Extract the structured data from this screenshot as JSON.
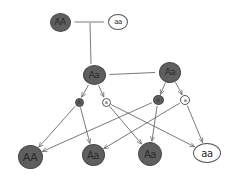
{
  "title": "",
  "colors": {
    "dominant_fill": "#5f5f5f",
    "recessive_fill": "#ffffff",
    "stroke": "#555555",
    "text": "#2a2a2a"
  },
  "parents": [
    {
      "id": "p1",
      "label": "AA",
      "phenotype": "dominant",
      "x": 60,
      "y": 22,
      "w": 21,
      "h": 19,
      "fs": 9
    },
    {
      "id": "p2",
      "label": "aa",
      "phenotype": "recessive",
      "x": 118,
      "y": 22,
      "w": 20,
      "h": 16,
      "fs": 7
    }
  ],
  "f1": [
    {
      "id": "f1a",
      "label": "Aa",
      "phenotype": "dominant",
      "x": 94,
      "y": 75,
      "w": 23,
      "h": 20,
      "fs": 9
    },
    {
      "id": "f1b",
      "label": "Aa",
      "phenotype": "dominant",
      "x": 170,
      "y": 72,
      "w": 22,
      "h": 21,
      "fs": 9
    }
  ],
  "gametes": [
    {
      "id": "g1",
      "label": "A",
      "phenotype": "dominant",
      "x": 79,
      "y": 102,
      "w": 9,
      "h": 9,
      "fs": 5
    },
    {
      "id": "g2",
      "label": "a",
      "phenotype": "recessive",
      "x": 106,
      "y": 102,
      "w": 9,
      "h": 9,
      "fs": 5
    },
    {
      "id": "g3",
      "label": "A",
      "phenotype": "dominant",
      "x": 158,
      "y": 100,
      "w": 11,
      "h": 10,
      "fs": 5
    },
    {
      "id": "g4",
      "label": "a",
      "phenotype": "recessive",
      "x": 185,
      "y": 100,
      "w": 10,
      "h": 10,
      "fs": 5
    }
  ],
  "f2": [
    {
      "id": "o1",
      "label": "AA",
      "phenotype": "dominant",
      "x": 30,
      "y": 157,
      "w": 25,
      "h": 24,
      "fs": 11
    },
    {
      "id": "o2",
      "label": "Aa",
      "phenotype": "dominant",
      "x": 93,
      "y": 155,
      "w": 23,
      "h": 22,
      "fs": 10
    },
    {
      "id": "o3",
      "label": "Aa",
      "phenotype": "dominant",
      "x": 150,
      "y": 154,
      "w": 24,
      "h": 24,
      "fs": 10
    },
    {
      "id": "o4",
      "label": "aa",
      "phenotype": "recessive",
      "x": 207,
      "y": 153,
      "w": 28,
      "h": 20,
      "fs": 10
    }
  ],
  "edges": [
    {
      "type": "cross",
      "from": "p1",
      "to": "p2"
    },
    {
      "type": "cross",
      "from": "f1a",
      "to": "f1b"
    },
    {
      "type": "descent",
      "from": "cross_p",
      "to": "f1a"
    },
    {
      "type": "arrow",
      "from": "f1a",
      "to": "g1"
    },
    {
      "type": "arrow",
      "from": "f1a",
      "to": "g2"
    },
    {
      "type": "arrow",
      "from": "f1b",
      "to": "g3"
    },
    {
      "type": "arrow",
      "from": "f1b",
      "to": "g4"
    },
    {
      "type": "arrow",
      "from": "g1",
      "to": "o1"
    },
    {
      "type": "arrow",
      "from": "g1",
      "to": "o2"
    },
    {
      "type": "arrow",
      "from": "g2",
      "to": "o3"
    },
    {
      "type": "arrow",
      "from": "g2",
      "to": "o4"
    },
    {
      "type": "arrow",
      "from": "g3",
      "to": "o1"
    },
    {
      "type": "arrow",
      "from": "g3",
      "to": "o3"
    },
    {
      "type": "arrow",
      "from": "g4",
      "to": "o2"
    },
    {
      "type": "arrow",
      "from": "g4",
      "to": "o4"
    }
  ]
}
